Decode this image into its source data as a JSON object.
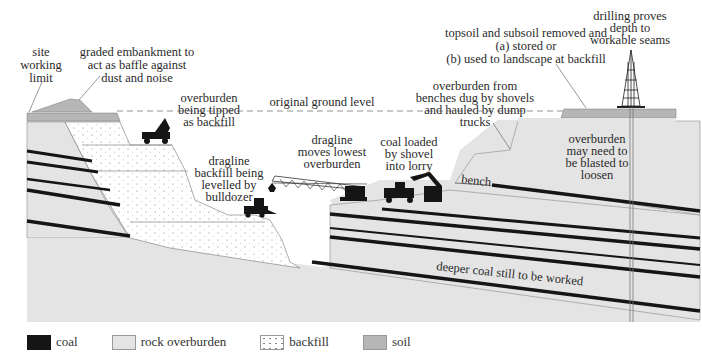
{
  "figure": {
    "labels": {
      "site_working_limit": [
        "site",
        "working",
        "limit"
      ],
      "graded_embankment": [
        "graded embankment to",
        "act as baffle against",
        "dust and noise"
      ],
      "overburden_tipped": [
        "overburden",
        "being tipped",
        "as backfill"
      ],
      "original_ground_level": "original ground level",
      "topsoil_subsoil": [
        "topsoil and subsoil removed and",
        "(a) stored or",
        "(b) used to landscape at backfill"
      ],
      "drilling": [
        "drilling proves",
        "depth to",
        "workable seams"
      ],
      "overburden_benches": [
        "overburden from",
        "benches dug by shovels",
        "and hauled by dump",
        "trucks"
      ],
      "dragline_moves": [
        "dragline",
        "moves lowest",
        "overburden"
      ],
      "coal_loaded": [
        "coal loaded",
        "by shovel",
        "into lorry"
      ],
      "dragline_backfill": [
        "dragline",
        "backfill being",
        "levelled by",
        "bulldozer"
      ],
      "bench": "bench",
      "overburden_blasted": [
        "overburden",
        "may need to",
        "be blasted to",
        "loosen"
      ],
      "deeper_coal": "deeper coal still to be worked"
    }
  },
  "legend": {
    "items": [
      {
        "key": "coal",
        "label": "coal",
        "color": "#151515"
      },
      {
        "key": "rock",
        "label": "rock overburden",
        "color": "#e4e4e4"
      },
      {
        "key": "backfill",
        "label": "backfill",
        "color": "#ffffff"
      },
      {
        "key": "soil",
        "label": "soil",
        "color": "#b6b6b6"
      }
    ]
  }
}
